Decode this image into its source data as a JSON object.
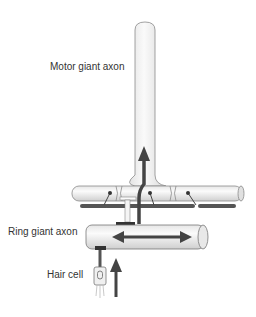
{
  "labels": {
    "motor_giant_axon": "Motor giant axon",
    "ring_giant_axon": "Ring giant axon",
    "hair_cell": "Hair cell"
  },
  "colors": {
    "axon_fill": "#f2f2f2",
    "axon_stroke": "#777777",
    "pathway": "#4a4a4a",
    "nerve_bar": "#555555",
    "text": "#333333"
  }
}
